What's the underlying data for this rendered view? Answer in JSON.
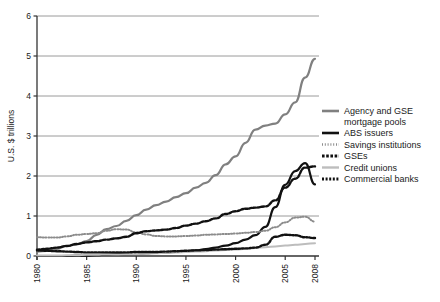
{
  "chart_data": {
    "type": "line",
    "title": "",
    "xlabel": "",
    "ylabel": "U.S. $ trillions",
    "xlim": [
      1980,
      2008
    ],
    "ylim": [
      0,
      6
    ],
    "yticks": [
      0,
      1,
      2,
      3,
      4,
      5,
      6
    ],
    "ytick_labels": [
      "0",
      "1",
      "2",
      "3",
      "4",
      "5",
      "6"
    ],
    "xticks": [
      1980,
      1985,
      1990,
      1995,
      2000,
      2005,
      2008
    ],
    "xtick_labels": [
      "1980",
      "1985",
      "1990",
      "1995",
      "2000",
      "2005",
      "2008"
    ],
    "grid": "horizontal",
    "legend_position": "right",
    "x": [
      1980,
      1981,
      1982,
      1983,
      1984,
      1985,
      1986,
      1987,
      1988,
      1989,
      1990,
      1991,
      1992,
      1993,
      1994,
      1995,
      1996,
      1997,
      1998,
      1999,
      2000,
      2001,
      2002,
      2003,
      2004,
      2005,
      2006,
      2007,
      2008
    ],
    "series": [
      {
        "name": "Agency and GSE mortgage pools",
        "color": "#808080",
        "style": "solid",
        "width": 2.2,
        "values": [
          0.11,
          0.13,
          0.18,
          0.25,
          0.29,
          0.37,
          0.53,
          0.67,
          0.75,
          0.88,
          1.02,
          1.16,
          1.27,
          1.36,
          1.47,
          1.57,
          1.71,
          1.83,
          2.02,
          2.29,
          2.49,
          2.83,
          3.16,
          3.26,
          3.31,
          3.54,
          3.84,
          4.46,
          4.93
        ]
      },
      {
        "name": "ABS issuers",
        "color": "#111111",
        "style": "solid",
        "width": 2.2,
        "values": [
          0.0,
          0.0,
          0.0,
          0.0,
          0.01,
          0.01,
          0.02,
          0.03,
          0.04,
          0.05,
          0.06,
          0.07,
          0.08,
          0.09,
          0.1,
          0.12,
          0.14,
          0.17,
          0.21,
          0.26,
          0.32,
          0.41,
          0.52,
          0.73,
          1.22,
          1.78,
          2.12,
          2.32,
          1.79
        ]
      },
      {
        "name": "Savings institutions",
        "color": "#8c8c8c",
        "style": "dotted",
        "width": 2.0,
        "values": [
          0.47,
          0.46,
          0.46,
          0.49,
          0.53,
          0.55,
          0.57,
          0.63,
          0.67,
          0.66,
          0.59,
          0.54,
          0.5,
          0.49,
          0.49,
          0.5,
          0.51,
          0.53,
          0.54,
          0.55,
          0.56,
          0.58,
          0.6,
          0.63,
          0.72,
          0.84,
          0.96,
          0.98,
          0.86
        ]
      },
      {
        "name": "GSEs",
        "color": "#111111",
        "style": "dashed",
        "width": 2.4,
        "values": [
          0.16,
          0.18,
          0.21,
          0.25,
          0.3,
          0.34,
          0.37,
          0.41,
          0.44,
          0.48,
          0.57,
          0.62,
          0.64,
          0.66,
          0.7,
          0.76,
          0.81,
          0.87,
          0.94,
          1.05,
          1.12,
          1.18,
          1.21,
          1.24,
          1.39,
          1.71,
          1.93,
          2.21,
          2.24
        ]
      },
      {
        "name": "Credit unions",
        "color": "#bdbdbd",
        "style": "solid",
        "width": 2.0,
        "values": [
          0.01,
          0.01,
          0.01,
          0.02,
          0.02,
          0.03,
          0.03,
          0.04,
          0.04,
          0.05,
          0.05,
          0.06,
          0.07,
          0.08,
          0.09,
          0.1,
          0.11,
          0.12,
          0.14,
          0.15,
          0.16,
          0.18,
          0.2,
          0.22,
          0.24,
          0.26,
          0.28,
          0.3,
          0.32
        ]
      },
      {
        "name": "Commercial banks",
        "color": "#111111",
        "style": "dotted-thick",
        "width": 2.4,
        "values": [
          0.14,
          0.13,
          0.12,
          0.11,
          0.1,
          0.09,
          0.09,
          0.09,
          0.09,
          0.09,
          0.1,
          0.1,
          0.1,
          0.11,
          0.12,
          0.13,
          0.14,
          0.15,
          0.16,
          0.17,
          0.18,
          0.19,
          0.21,
          0.28,
          0.48,
          0.53,
          0.52,
          0.47,
          0.45
        ]
      }
    ]
  },
  "legend": {
    "items": [
      {
        "label_line1": "Agency and GSE",
        "label_line2": "mortgage pools",
        "swatch": "solid-grey"
      },
      {
        "label_line1": "ABS issuers",
        "label_line2": "",
        "swatch": "solid-black"
      },
      {
        "label_line1": "Savings institutions",
        "label_line2": "",
        "swatch": "dotted-grey"
      },
      {
        "label_line1": "GSEs",
        "label_line2": "",
        "swatch": "dashed-black"
      },
      {
        "label_line1": "Credit unions",
        "label_line2": "",
        "swatch": "solid-lightgrey"
      },
      {
        "label_line1": "Commercial banks",
        "label_line2": "",
        "swatch": "dotted-black"
      }
    ]
  }
}
